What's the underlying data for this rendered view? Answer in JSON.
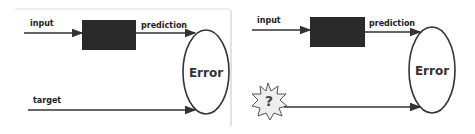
{
  "panels": [
    {
      "id": "supervised",
      "input_label": "input",
      "prediction_label": "prediction",
      "error_label": "Error",
      "target_label": "target"
    },
    {
      "id": "unknown-target",
      "input_label": "input",
      "prediction_label": "prediction",
      "error_label": "Error",
      "unknown_symbol": "?"
    }
  ],
  "colors": {
    "box": "#2a2a2a",
    "line": "#333333",
    "starburst_fill": "#eeeeee"
  }
}
